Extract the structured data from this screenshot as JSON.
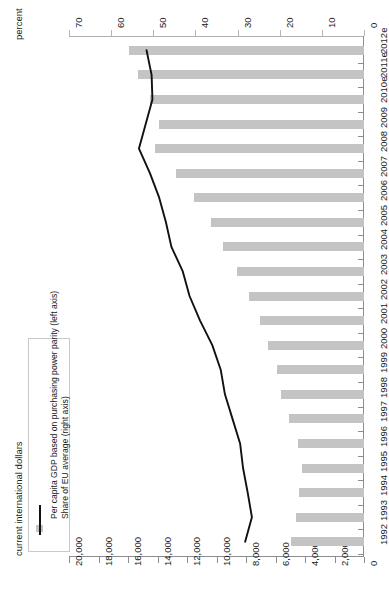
{
  "axes": {
    "top_title": "percent",
    "bottom_title": "current international dollars",
    "percent_ticks": [
      "70",
      "60",
      "50",
      "40",
      "30",
      "20",
      "10",
      "0"
    ],
    "dollar_ticks": [
      "20,000",
      "18,000",
      "16,000",
      "14,000",
      "12,000",
      "10,000",
      "8,000",
      "6,000",
      "4,000",
      "2,000",
      "0"
    ]
  },
  "legend": {
    "bar_label": "Per capita GDP based on purchasing power parity (left axis)",
    "line_label": "Share of EU average (right axis)",
    "bar_color": "#c4c4c4",
    "line_color": "#111111"
  },
  "chart_data": {
    "type": "bar",
    "orientation": "horizontal",
    "title": "",
    "xlabel": "current international dollars",
    "ylabel": "",
    "secondary_xlabel": "percent",
    "xlim": [
      0,
      20000
    ],
    "secondary_xlim": [
      0,
      70
    ],
    "grid": false,
    "legend_position": "bottom-left",
    "categories": [
      "1992",
      "1993",
      "1994",
      "1995",
      "1996",
      "1997",
      "1998",
      "1999",
      "2000",
      "2001",
      "2002",
      "2003",
      "2004",
      "2005",
      "2006",
      "2007",
      "2008",
      "2009",
      "2010e",
      "2011e",
      "2012e"
    ],
    "series": [
      {
        "name": "Per capita GDP based on purchasing power parity (left axis)",
        "type": "bar",
        "axis": "bottom",
        "units": "current international dollars",
        "values": [
          4950,
          4640,
          4380,
          4200,
          4450,
          5080,
          5620,
          5930,
          6510,
          7080,
          7830,
          8620,
          9560,
          10380,
          11550,
          12780,
          14180,
          13900,
          14480,
          15290,
          15940
        ]
      },
      {
        "name": "Share of EU average (right axis)",
        "type": "line",
        "axis": "top",
        "units": "percent",
        "values": [
          28.2,
          26.6,
          27.6,
          28.7,
          29.4,
          31.2,
          33.0,
          34.0,
          36.0,
          38.9,
          41.4,
          43.0,
          45.7,
          47.0,
          48.6,
          50.8,
          53.4,
          51.8,
          50.2,
          50.4,
          51.6
        ]
      }
    ]
  }
}
